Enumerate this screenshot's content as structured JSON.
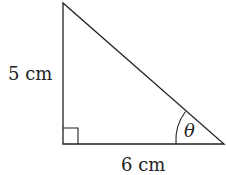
{
  "diagram": {
    "type": "right-triangle",
    "labels": {
      "vertical_side": "5 cm",
      "horizontal_side": "6 cm",
      "angle": "θ"
    },
    "right_angle_marker": true,
    "stroke_color": "#222222"
  }
}
